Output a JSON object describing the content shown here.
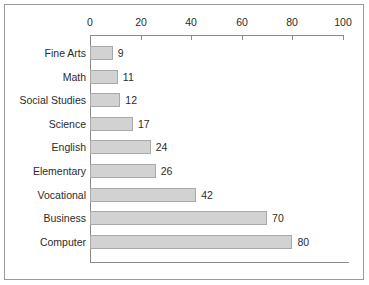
{
  "chart_data": {
    "type": "bar",
    "orientation": "horizontal",
    "title": "",
    "subtitle": "",
    "xlabel": "",
    "ylabel": "",
    "xlim": [
      0,
      100
    ],
    "grid": false,
    "legend": null,
    "axis_position": "top",
    "categories": [
      "Fine Arts",
      "Math",
      "Social Studies",
      "Science",
      "English",
      "Elementary",
      "Vocational",
      "Business",
      "Computer"
    ],
    "values": [
      9,
      11,
      12,
      17,
      24,
      26,
      42,
      70,
      80
    ],
    "data_labels": [
      "9",
      "11",
      "12",
      "17",
      "24",
      "26",
      "42",
      "70",
      "80"
    ],
    "xticks": [
      0,
      20,
      40,
      60,
      80,
      100
    ],
    "xtick_labels": [
      "0",
      "20",
      "40",
      "60",
      "80",
      "100"
    ],
    "colors": {
      "bar_fill": "#d2d2d2",
      "bar_border": "#a9a9a9",
      "axis": "#8a8a8a",
      "text": "#2b2b2b",
      "frame": "#9a9a9a",
      "background": "#ffffff"
    }
  }
}
